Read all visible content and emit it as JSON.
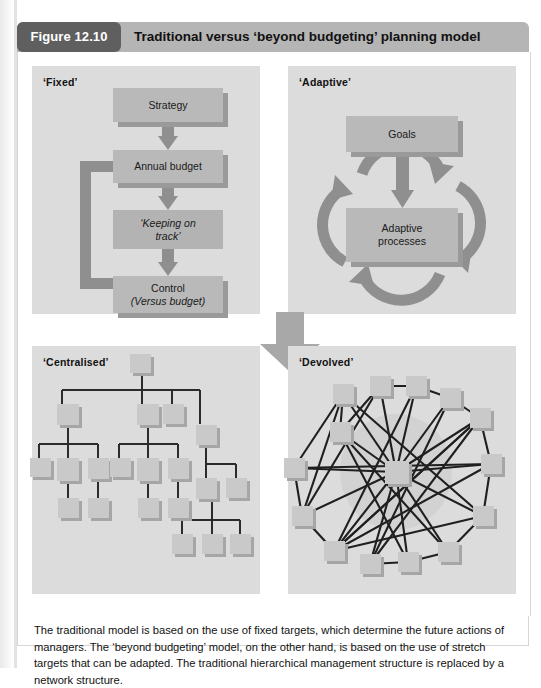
{
  "figure": {
    "badge": "Figure 12.10",
    "title": "Traditional versus ‘beyond budgeting’ planning model",
    "caption": "The traditional model is based on the use of fixed targets, which determine the future actions of managers. The ‘beyond budgeting’ model, on the other hand, is based on the use of stretch targets that can be adapted. The traditional hierarchical management structure is replaced by a network structure.",
    "colors": {
      "header_band": "#b5b5b5",
      "badge_bg": "#5f5f5f",
      "quadrant_bg": "#dcdcdc",
      "box_fill": "#b9b9b9",
      "box_shadow": "#9a9a9a",
      "node_fill": "#c9c9c9",
      "node_shadow": "#a6a6a6",
      "arrow_fill": "#8f8f8f",
      "line_stroke": "#2b2b2b",
      "page_bg": "#ffffff"
    }
  },
  "quadrants": {
    "fixed": {
      "label": "‘Fixed’",
      "boxes": [
        {
          "id": "strategy",
          "text": "Strategy"
        },
        {
          "id": "annual-budget",
          "text": "Annual budget"
        },
        {
          "id": "keeping-on-track",
          "text": "‘Keeping on\ntrack’",
          "line1": "‘Keeping on",
          "line2": "track’",
          "italic": true
        },
        {
          "id": "control",
          "line1": "Control",
          "line2": "(Versus budget)"
        }
      ],
      "flow": [
        "Strategy",
        "Annual budget",
        "‘Keeping on track’",
        "Control (Versus budget)"
      ],
      "feedback_loop": "Control back to Annual budget"
    },
    "adaptive": {
      "label": "‘Adaptive’",
      "boxes": [
        {
          "id": "goals",
          "text": "Goals"
        },
        {
          "id": "adaptive-processes",
          "line1": "Adaptive",
          "line2": "processes"
        }
      ],
      "cycle_arrows": 4,
      "flow": [
        "Goals",
        "Adaptive processes"
      ]
    },
    "centralised": {
      "label": "‘Centralised’",
      "structure_type": "hierarchy-tree",
      "node_count": 21,
      "levels": 5
    },
    "devolved": {
      "label": "‘Devolved’",
      "structure_type": "network-mesh",
      "node_count": 16,
      "hub_nodes": 1
    }
  },
  "transition": {
    "name": "transition-arrow",
    "direction": "down-right",
    "from": "top-row (Fixed / Adaptive)",
    "to": "bottom-row (Centralised / Devolved)"
  }
}
